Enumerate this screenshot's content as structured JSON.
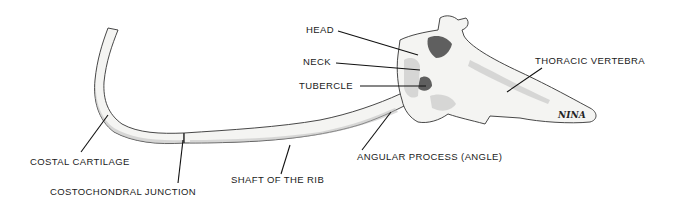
{
  "figure": {
    "signature": "NINA",
    "labels": {
      "head": "HEAD",
      "neck": "NECK",
      "tubercle": "TUBERCLE",
      "thoracic_vertebra": "THORACIC VERTEBRA",
      "angular_process": "ANGULAR PROCESS (ANGLE)",
      "shaft": "SHAFT OF THE RIB",
      "costal_cartilage": "COSTAL CARTILAGE",
      "costochondral_junction": "COSTOCHONDRAL JUNCTION"
    },
    "colors": {
      "background": "#ffffff",
      "bone_fill": "#f4f4f2",
      "outline": "#333333",
      "text": "#1a1a1a"
    }
  }
}
